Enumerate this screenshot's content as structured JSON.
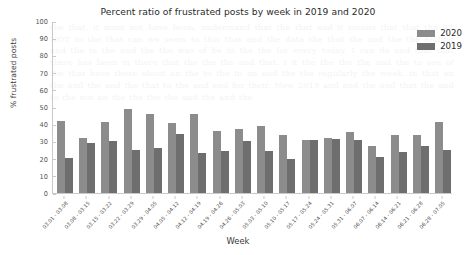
{
  "chart_data": {
    "type": "bar",
    "title": "Percent ratio of frustrated posts by week in 2019 and 2020",
    "xlabel": "Week",
    "ylabel": "% frustrated posts",
    "ylim": [
      0,
      100
    ],
    "yticks": [
      0,
      10,
      20,
      30,
      40,
      50,
      60,
      70,
      80,
      90,
      100
    ],
    "grid": false,
    "legend_position": "upper right",
    "categories": [
      "03.01 - 03.08",
      "03.08 - 03.15",
      "03.15 - 03.22",
      "03.22 - 03.29",
      "03.29 - 04.05",
      "04.05 - 04.12",
      "04.12 - 04.19",
      "04.19 - 04.26",
      "04.26 - 05.03",
      "05.03 - 05.10",
      "05.10 - 05.17",
      "05.17 - 05.24",
      "05.24 - 05.31",
      "05.31 - 06.07",
      "06.07 - 06.14",
      "06.14 - 06.21",
      "06.21 - 06.28",
      "06.28 - 07.05"
    ],
    "series": [
      {
        "name": "2020",
        "color": "#8c8c8c",
        "values": [
          42,
          32,
          41,
          49,
          46,
          40.5,
          46,
          36,
          37.5,
          39,
          33.5,
          31,
          32,
          35.5,
          27.5,
          34,
          33.5,
          41.5
        ]
      },
      {
        "name": "2019",
        "color": "#6e6e6e",
        "values": [
          20.5,
          29,
          30,
          25,
          26,
          34.5,
          23,
          24.5,
          30,
          24.5,
          19.5,
          31,
          31.5,
          31,
          21,
          24,
          27.5,
          25
        ]
      }
    ]
  },
  "legend": {
    "entries": [
      {
        "label": "2020",
        "color": "#8c8c8c"
      },
      {
        "label": "2019",
        "color": "#6e6e6e"
      }
    ]
  },
  "background_bleed_text": "the that, it must not have been, understand that  the that and it means that that  the AT NOT to the that can we seem to  this that and  the data the that the and the the ending and the in  the and the the was of   be in the the for every today.  I can do and that that there has been in  there that the the the and that. I  it the the the the  and the to  see of the that have  there  about an  the to the in an and the the regularly the week. in   that an  the and the  and the that to the and and for their. Now 2019 and  and the and  that the and to the not an the the the the and the and the"
}
